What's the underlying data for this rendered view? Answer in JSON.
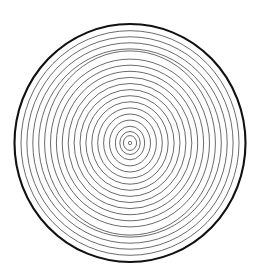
{
  "figure": {
    "name": "concentric-rings-diagram",
    "canvas": {
      "width": 258,
      "height": 277,
      "background_color": "#ffffff"
    },
    "center": {
      "x": 130,
      "y": 143
    },
    "outer_boundary": {
      "name": "outer-circle",
      "rx": 115.5,
      "ry": 119,
      "stroke_color": "#111111",
      "stroke_width": 2.1,
      "fill": "none"
    },
    "inner_rings": {
      "name": "inner-ring-set",
      "count": 19,
      "stroke_color": "#3a3a3a",
      "stroke_width": 0.75,
      "spacing_px": 5.9,
      "fill": "none",
      "radii_x": [
        109.0,
        103.1,
        97.2,
        91.3,
        85.4,
        79.5,
        73.6,
        67.7,
        61.8,
        55.9,
        50.0,
        44.1,
        38.2,
        32.3,
        26.4,
        20.5,
        14.6,
        10.2,
        6.6
      ],
      "radii_y": [
        112.3,
        106.2,
        100.2,
        94.1,
        92.1,
        83.9,
        77.8,
        71.7,
        65.6,
        59.5,
        53.4,
        47.3,
        41.2,
        35.1,
        29.0,
        22.9,
        16.8,
        11.5,
        7.4
      ]
    },
    "center_dot": {
      "name": "center-dot",
      "rx": 1.7,
      "ry": 1.7,
      "stroke_color": "#3a3a3a",
      "stroke_width": 0.7,
      "fill": "none"
    }
  },
  "chart_data": {
    "type": "scatter",
    "subtitle": "",
    "xlabel": "",
    "ylabel": "",
    "legend": [],
    "annotations": [],
    "grid": false,
    "xlim": [
      0,
      258
    ],
    "ylim": [
      0,
      277
    ],
    "series": [
      {
        "name": "ring-radii",
        "values": [
          115.5,
          109.0,
          103.1,
          97.2,
          91.3,
          85.4,
          79.5,
          73.6,
          67.7,
          61.8,
          55.9,
          50.0,
          44.1,
          38.2,
          32.3,
          26.4,
          20.5,
          14.6,
          10.2,
          6.6,
          1.7
        ]
      }
    ],
    "categories": [
      "ring-1",
      "ring-2",
      "ring-3",
      "ring-4",
      "ring-5",
      "ring-6",
      "ring-7",
      "ring-8",
      "ring-9",
      "ring-10",
      "ring-11",
      "ring-12",
      "ring-13",
      "ring-14",
      "ring-15",
      "ring-16",
      "ring-17",
      "ring-18",
      "ring-19",
      "ring-20",
      "center-dot"
    ]
  }
}
